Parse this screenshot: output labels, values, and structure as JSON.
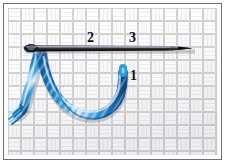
{
  "figure": {
    "description": "Woven fabric swatch with a threaded needle and a blue embroidery floss loop, with numbered stitch entry/exit points",
    "background_color": "#ffffff",
    "frame_color": "#6f6f6f"
  },
  "fabric": {
    "name": "woven-fabric-swatch",
    "weave_type": "basket-weave",
    "base_color": "#fafafa",
    "thread_line_color": "#c9c9cd",
    "shadow_color": "#d8d8dc"
  },
  "needle": {
    "name": "sewing-needle",
    "color": "#1d1d22",
    "highlight_color": "#8c8c98",
    "eye_position": "left",
    "tip_position": "right",
    "label": "needle"
  },
  "thread": {
    "name": "embroidery-floss",
    "label": "blue embroidery floss",
    "color_main": "#2f9fe0",
    "color_light": "#bfe4f7",
    "color_dark": "#1364a5",
    "color_deep": "#0d4c86"
  },
  "labels": [
    {
      "id": "label-2",
      "text": "2",
      "meaning": "needle entry point two",
      "x": 87,
      "y": 31
    },
    {
      "id": "label-3",
      "text": "3",
      "meaning": "needle exit point three",
      "x": 129,
      "y": 31
    },
    {
      "id": "label-1",
      "text": "1",
      "meaning": "thread emergence point one",
      "x": 130,
      "y": 69
    }
  ]
}
